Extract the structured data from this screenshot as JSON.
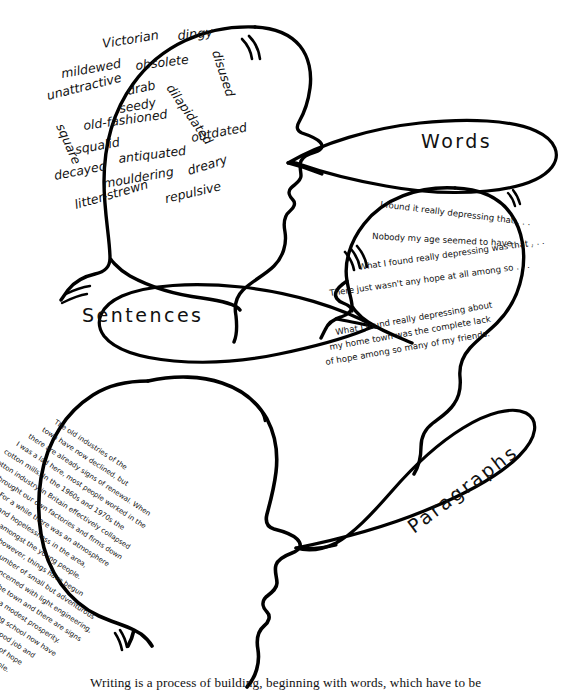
{
  "figure": {
    "title": "Writing is a process of building",
    "caption": "Writing is a process of building, beginning with words, which have to be",
    "ink_color": "#000000",
    "background_color": "#ffffff"
  },
  "labels": {
    "words": "Words",
    "sentences": "Sentences",
    "paragraphs": "Paragraphs"
  },
  "head_words": {
    "title": "Words",
    "items": [
      "Victorian",
      "dingy",
      "obsolete",
      "disused",
      "mildewed",
      "drab",
      "dilapidated",
      "unattractive",
      "seedy",
      "square",
      "old-fashioned",
      "outdated",
      "squalid",
      "antiquated",
      "decayed",
      "dreary",
      "mouldering",
      "repulsive",
      "litter-strewn"
    ]
  },
  "head_sentences": {
    "title": "Sentences",
    "lines": [
      "I found it really depressing that . . .",
      "Nobody my age seemed to have . . . .",
      "What I found really depressing was that . . .",
      "There just wasn't any hope at all among so . . .",
      "What I found really depressing about",
      "my home town was the complete lack",
      "of hope among so many of my friends."
    ]
  },
  "head_paragraphs": {
    "title": "Paragraphs",
    "lines": [
      "The old industries of the",
      "town have now declined, but",
      "there are already signs of renewal. When",
      "I was a lad here, most people worked in the",
      "cotton mills. In the 1960s and 1970s the",
      "cotton industry in Britain effectively collapsed",
      "and brought our own factories and firms down",
      "with it. For a while there was an atmosphere",
      "of gloom and hopelessness in the area,",
      "particularly amongst the young people.",
      "Now at last, however, things have begun",
      "to change. A number of small but adventurous",
      "firms, mainly concerned with light engineering,",
      "have come into the town and there are signs",
      "of recovery - even a modest prosperity.",
      "Young people leaving school now have",
      "a real chance of a good job and",
      "there are new signs of hope",
      "amongst all our people."
    ]
  }
}
